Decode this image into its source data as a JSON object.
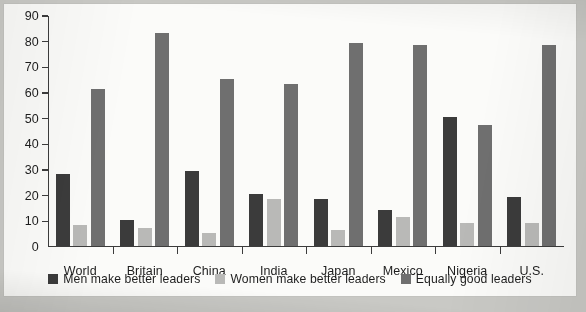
{
  "chart_data": {
    "type": "bar",
    "title": "",
    "subtitle": "",
    "xlabel": "",
    "ylabel": "",
    "ylim": [
      0,
      90
    ],
    "yticks": [
      0,
      10,
      20,
      30,
      40,
      50,
      60,
      70,
      80,
      90
    ],
    "grid": false,
    "legend_position": "bottom",
    "categories": [
      "World",
      "Britain",
      "China",
      "India",
      "Japan",
      "Mexico",
      "Nigeria",
      "U.S."
    ],
    "series": [
      {
        "name": "Men make better leaders",
        "color": "#3b3b3b",
        "values": [
          28,
          10,
          29,
          20,
          18,
          14,
          50,
          19
        ]
      },
      {
        "name": "Women make better leaders",
        "color": "#b9b9b7",
        "values": [
          8,
          7,
          5,
          18,
          6,
          11,
          9,
          9
        ]
      },
      {
        "name": "Equally good leaders",
        "color": "#6f6f6f",
        "values": [
          61,
          83,
          65,
          63,
          79,
          78,
          47,
          78
        ]
      }
    ]
  },
  "page": {
    "background_color": "#c9c9c5",
    "card_color": "#fbfbf9"
  }
}
